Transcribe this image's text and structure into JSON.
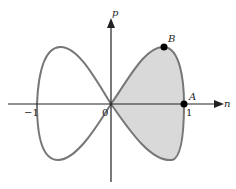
{
  "figure": {
    "axes": {
      "x_label": "n",
      "y_label": "p"
    },
    "ticks": {
      "neg_one": "−1",
      "zero": "0",
      "one": "1"
    },
    "points": {
      "A": "A",
      "B": "B"
    },
    "colors": {
      "curve": "#777777",
      "shade": "#d9d9d9",
      "axis": "#222222",
      "point": "#000000"
    }
  }
}
